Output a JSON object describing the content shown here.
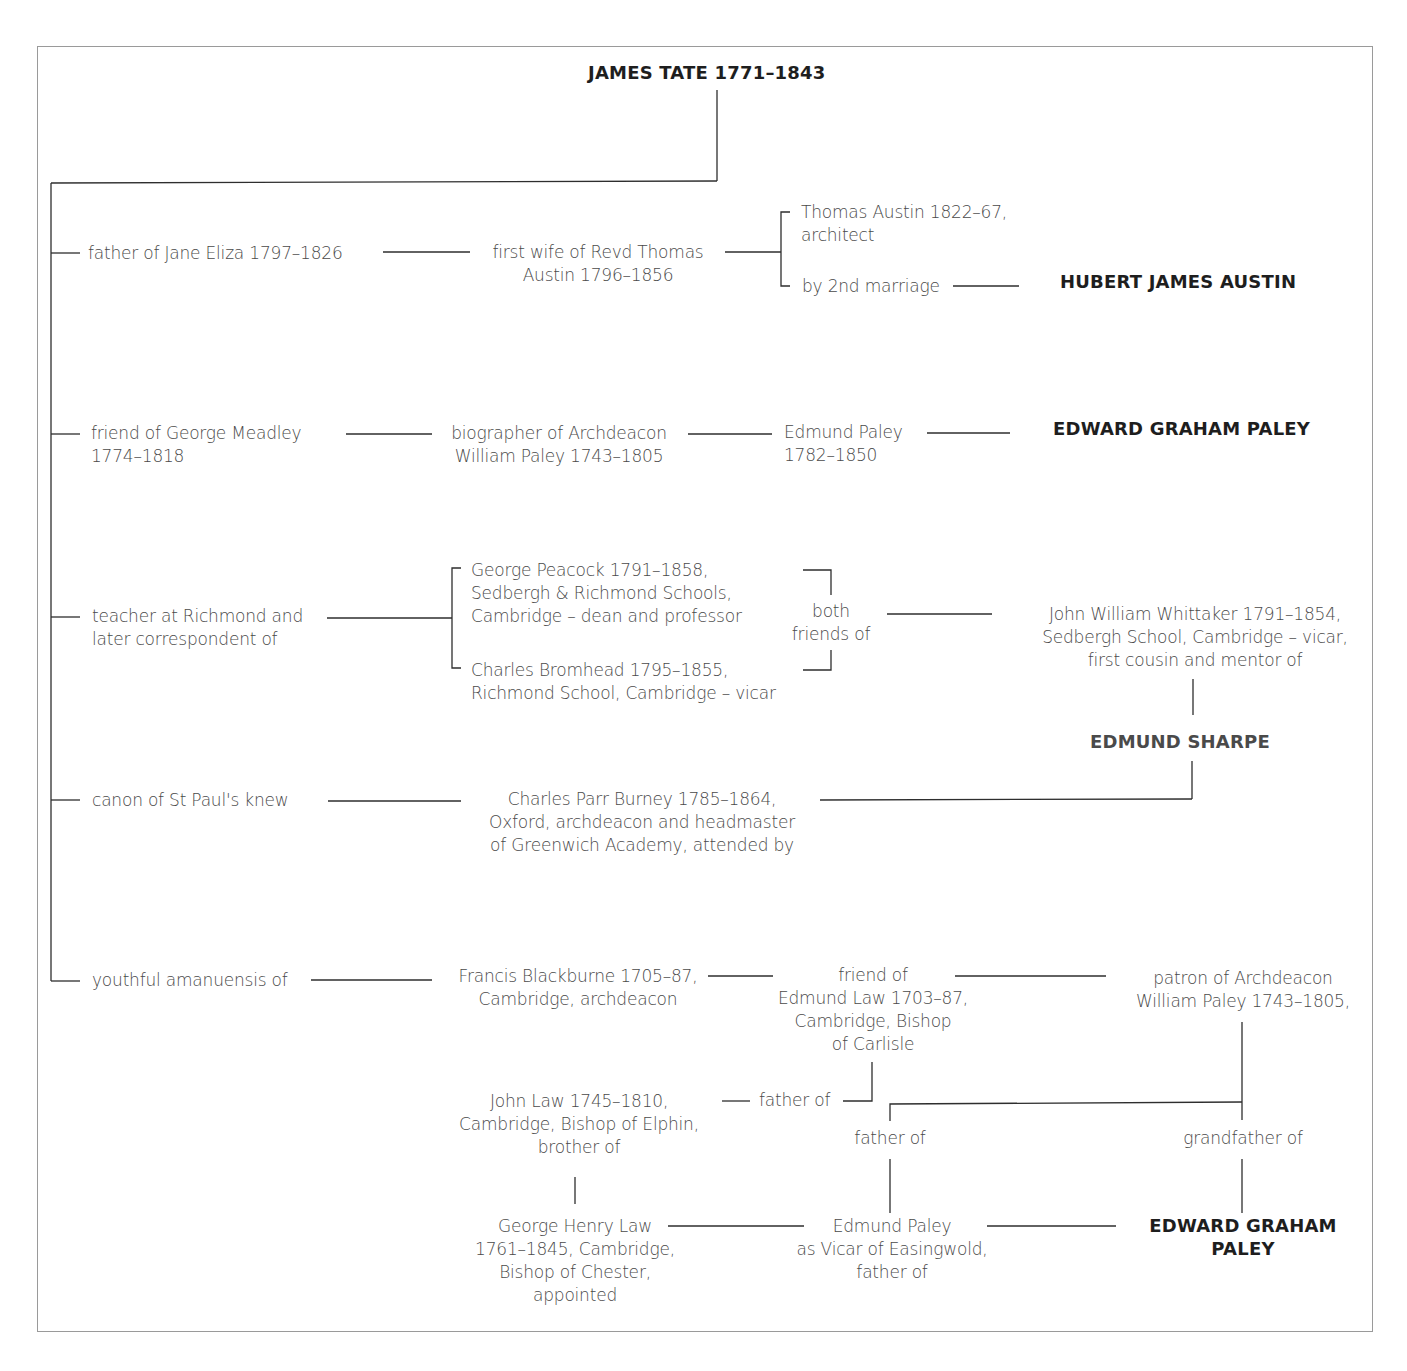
{
  "title": "JAMES TATE 1771–1843",
  "branches": {
    "austin": {
      "relation": "father of Jane Eliza 1797–1826",
      "spouse": "first wife of Revd Thomas\nAustin 1796–1856",
      "child1": "Thomas Austin 1822–67,\narchitect",
      "child2": "by 2nd marriage",
      "target": "HUBERT JAMES AUSTIN"
    },
    "meadley": {
      "relation": "friend of George Meadley\n1774–1818",
      "step1": "biographer of Archdeacon\nWilliam Paley 1743–1805",
      "step2": "Edmund Paley\n1782–1850",
      "target": "EDWARD GRAHAM PALEY"
    },
    "richmond": {
      "relation": "teacher at Richmond and\nlater correspondent of",
      "person1": "George Peacock 1791–1858,\nSedbergh & Richmond Schools,\nCambridge – dean and professor",
      "person2": "Charles Bromhead 1795–1855,\nRichmond School, Cambridge – vicar",
      "joint": "both\nfriends of",
      "mentor": "John William Whittaker 1791–1854,\nSedbergh School, Cambridge – vicar,\nfirst cousin and mentor of",
      "target": "EDMUND SHARPE"
    },
    "stpauls": {
      "relation": "canon of St Paul's knew",
      "person": "Charles Parr Burney 1785–1864,\nOxford, archdeacon and headmaster\nof Greenwich Academy, attended by"
    },
    "amanuensis": {
      "relation": "youthful amanuensis of",
      "blackburne": "Francis Blackburne 1705–87,\nCambridge, archdeacon",
      "edmund_law": "friend of\nEdmund Law 1703–87,\nCambridge, Bishop\nof Carlisle",
      "patron": "patron of Archdeacon\nWilliam Paley 1743–1805,",
      "father_of_1": "father of",
      "john_law": "John Law 1745–1810,\nCambridge, Bishop of Elphin,\nbrother of",
      "father_of_2": "father of",
      "grandfather_of": "grandfather of",
      "george_henry_law": "George Henry Law\n1761–1845, Cambridge,\nBishop of Chester,\nappointed",
      "edmund_paley": "Edmund Paley\nas Vicar of Easingwold,\nfather of",
      "target": "EDWARD GRAHAM\nPALEY"
    }
  }
}
